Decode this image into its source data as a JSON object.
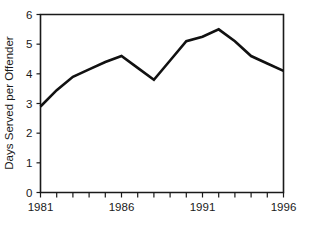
{
  "chart_data": {
    "type": "line",
    "title": "",
    "xlabel": "",
    "ylabel": "Days Served per Offender",
    "xlim": [
      1981,
      1996
    ],
    "ylim": [
      0,
      6
    ],
    "grid": false,
    "legend": false,
    "x": [
      1981,
      1982,
      1983,
      1984,
      1985,
      1986,
      1987,
      1988,
      1989,
      1990,
      1991,
      1992,
      1993,
      1994,
      1995,
      1996
    ],
    "values": [
      2.9,
      3.45,
      3.9,
      4.15,
      4.4,
      4.6,
      4.2,
      3.8,
      4.45,
      5.1,
      5.25,
      5.5,
      5.1,
      4.6,
      4.35,
      4.1
    ],
    "series": [
      {
        "name": "Days Served per Offender",
        "color": "#111111",
        "values": [
          2.9,
          3.45,
          3.9,
          4.15,
          4.4,
          4.6,
          4.2,
          3.8,
          4.45,
          5.1,
          5.25,
          5.5,
          5.1,
          4.6,
          4.35,
          4.1
        ]
      }
    ],
    "y_ticks": [
      0,
      1,
      2,
      3,
      4,
      5,
      6
    ],
    "y_tick_labels": [
      "0",
      "1",
      "2",
      "3",
      "4",
      "5",
      "6"
    ],
    "x_ticks": [
      1981,
      1982,
      1983,
      1984,
      1985,
      1986,
      1987,
      1988,
      1989,
      1990,
      1991,
      1992,
      1993,
      1994,
      1995,
      1996
    ],
    "x_tick_labels": [
      "1981",
      "",
      "",
      "",
      "",
      "1986",
      "",
      "",
      "",
      "",
      "1991",
      "",
      "",
      "",
      "",
      "1996"
    ]
  },
  "axes": {
    "y_axis_title": "Days Served per Offender"
  },
  "colors": {
    "line": "#111111",
    "frame": "#1a1a1a",
    "background": "#ffffff",
    "text": "#1a1a1a"
  }
}
